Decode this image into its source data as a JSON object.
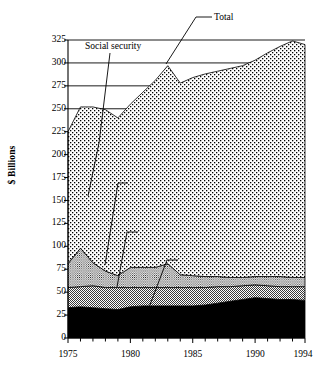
{
  "chart_data": {
    "type": "area",
    "stacked": true,
    "title": "",
    "subtitle": "",
    "xlabel": "",
    "ylabel": "$ Billions",
    "xlim": [
      1975,
      1994
    ],
    "ylim": [
      0,
      325
    ],
    "yticks": [
      0,
      25,
      50,
      75,
      100,
      125,
      150,
      175,
      200,
      225,
      250,
      275,
      300,
      325
    ],
    "xticks": [
      1975,
      1980,
      1985,
      1990,
      1994
    ],
    "xtick_labels": [
      "1975",
      "1980",
      "1985",
      "1990",
      "1994"
    ],
    "xminor_ticks": [
      1976,
      1977,
      1978,
      1979,
      1981,
      1982,
      1983,
      1984,
      1986,
      1987,
      1988,
      1989,
      1991,
      1992,
      1993
    ],
    "grid": "horizontal-major-upper-only",
    "gridlines": [
      250,
      275,
      300,
      325
    ],
    "legend_position": "inline-annotations",
    "x": [
      1975,
      1976,
      1977,
      1978,
      1979,
      1980,
      1981,
      1982,
      1983,
      1984,
      1985,
      1986,
      1987,
      1988,
      1989,
      1990,
      1991,
      1992,
      1993,
      1994
    ],
    "series": [
      {
        "name": "Public assistance",
        "fill": "#000000",
        "pattern": "solid-black",
        "values": [
          33,
          34,
          33,
          32,
          31,
          34,
          35,
          35,
          35,
          35,
          35,
          36,
          38,
          40,
          42,
          44,
          43,
          42,
          42,
          41
        ]
      },
      {
        "name": "Veteran",
        "fill": "#a8a8a8",
        "pattern": "gray-checker",
        "values": [
          22,
          22,
          24,
          23,
          24,
          21,
          20,
          20,
          20,
          20,
          20,
          19,
          18,
          16,
          15,
          14,
          14,
          14,
          14,
          15
        ]
      },
      {
        "name": "Unemployment",
        "fill": "#ffffff",
        "pattern": "fine-dot",
        "values": [
          26,
          42,
          25,
          18,
          13,
          22,
          22,
          22,
          26,
          14,
          13,
          12,
          11,
          10,
          9,
          9,
          10,
          11,
          10,
          10
        ]
      },
      {
        "name": "Social security",
        "fill": "#ffffff",
        "pattern": "coarse-dot",
        "values": [
          144,
          154,
          170,
          176,
          172,
          178,
          191,
          204,
          216,
          209,
          216,
          221,
          224,
          228,
          231,
          236,
          244,
          251,
          258,
          254
        ]
      }
    ],
    "total": {
      "name": "Total",
      "values": [
        225,
        252,
        252,
        249,
        240,
        255,
        268,
        281,
        297,
        278,
        284,
        288,
        291,
        294,
        297,
        303,
        311,
        318,
        324,
        320
      ]
    },
    "annotations": [
      {
        "label": "Total",
        "x": 1994,
        "y": 325
      },
      {
        "label": "Social security",
        "x": 1976,
        "y": 313
      },
      {
        "label": "Unemployment",
        "x": 1980,
        "y": 188
      },
      {
        "label": "Veteran",
        "x": 1982,
        "y": 142
      },
      {
        "label": "Public assistance",
        "x": 1985,
        "y": 113
      }
    ]
  },
  "axis": {
    "y_title": "$ Billions",
    "y_ticks": [
      "325",
      "300",
      "275",
      "250",
      "225",
      "200",
      "175",
      "150",
      "125",
      "100",
      "75",
      "50",
      "25",
      "0"
    ],
    "x_ticks": [
      "1975",
      "1980",
      "1985",
      "1990",
      "1994"
    ]
  },
  "labels": {
    "total": "Total",
    "social_security": "Social security",
    "unemployment": "Unemployment",
    "veteran": "Veteran",
    "public_assistance": "Public assistance"
  }
}
